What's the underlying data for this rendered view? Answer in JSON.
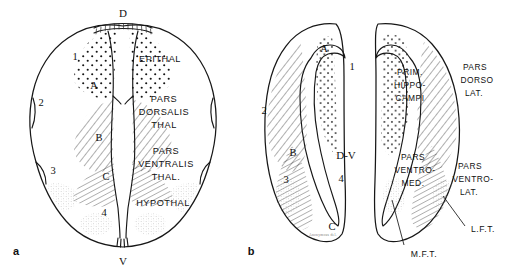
{
  "figure": {
    "background_color": "#ffffff",
    "ink_color": "#171717"
  },
  "panels": [
    {
      "id": "a",
      "label": "a",
      "axis_markers": [
        {
          "name": "dorsal",
          "text": "D"
        },
        {
          "name": "ventral",
          "text": "V"
        }
      ],
      "zone_markers": [
        {
          "text": "1"
        },
        {
          "text": "2"
        },
        {
          "text": "3"
        },
        {
          "text": "4"
        },
        {
          "text": "A"
        },
        {
          "text": "B"
        },
        {
          "text": "C"
        }
      ],
      "region_labels": [
        {
          "text": "EPITHAL",
          "lines": [
            "EPITHAL"
          ]
        },
        {
          "text": "PARS DORSALIS THAL",
          "lines": [
            "PARS",
            "DORSALIS",
            "THAL"
          ]
        },
        {
          "text": "PARS VENTRALIS THAL.",
          "lines": [
            "PARS",
            "VENTRALIS",
            "THAL."
          ]
        },
        {
          "text": "HYPOTHAL",
          "lines": [
            "HYPOTHAL"
          ]
        }
      ]
    },
    {
      "id": "b",
      "label": "b",
      "axis_markers": [
        {
          "name": "dorso-ventral-sulcus",
          "text": "D-V"
        }
      ],
      "zone_markers": [
        {
          "text": "1"
        },
        {
          "text": "2"
        },
        {
          "text": "3"
        },
        {
          "text": "4"
        },
        {
          "text": "A"
        },
        {
          "text": "B"
        },
        {
          "text": "C"
        }
      ],
      "region_labels": [
        {
          "text": "PRIM. HIPPO- CAMPI",
          "lines": [
            "PRIM.",
            "HIPPO-",
            "CAMPI"
          ]
        },
        {
          "text": "PARS DORSO LAT.",
          "lines": [
            "PARS",
            "DORSO",
            "LAT."
          ]
        },
        {
          "text": "PARS VENTRO- MED.",
          "lines": [
            "PARS",
            "VENTRO-",
            "MED."
          ]
        },
        {
          "text": "PARS VENTRO- LAT.",
          "lines": [
            "PARS",
            "VENTRO-",
            "LAT."
          ]
        }
      ],
      "tract_labels": [
        {
          "name": "medial-forebrain-tract",
          "text": "M.F.T."
        },
        {
          "name": "lateral-forebrain-tract",
          "text": "L.F.T."
        }
      ],
      "signature": "Anonymous del."
    }
  ],
  "text": {
    "a": {
      "panel_label": "a",
      "dorsal": "D",
      "ventral": "V",
      "m1": "1",
      "m2": "2",
      "m3": "3",
      "m4": "4",
      "mA": "A",
      "mB": "B",
      "mC": "C",
      "epithal": "EPITHAL",
      "pd1": "PARS",
      "pd2": "DORSALIS",
      "pd3": "THAL",
      "pv1": "PARS",
      "pv2": "VENTRALIS",
      "pv3": "THAL.",
      "hypothal": "HYPOTHAL"
    },
    "b": {
      "panel_label": "b",
      "dv": "D-V",
      "m1": "1",
      "m2": "2",
      "m3": "3",
      "m4": "4",
      "mA": "A",
      "mB": "B",
      "mC": "C",
      "ph1": "PRIM.",
      "ph2": "HIPPO-",
      "ph3": "CAMPI",
      "pdl1": "PARS",
      "pdl2": "DORSO",
      "pdl3": "LAT.",
      "pvm1": "PARS",
      "pvm2": "VENTRO-",
      "pvm3": "MED.",
      "pvl1": "PARS",
      "pvl2": "VENTRO-",
      "pvl3": "LAT.",
      "mft": "M.F.T.",
      "lft": "L.F.T.",
      "signature": "Anonymous del."
    }
  }
}
